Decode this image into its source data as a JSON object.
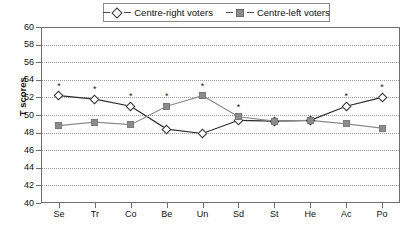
{
  "chart_data": {
    "type": "line",
    "title": "",
    "xlabel": "",
    "ylabel": "T scores",
    "ylim": [
      40,
      60
    ],
    "ytick_step": 2,
    "yticks": [
      60,
      58,
      56,
      54,
      52,
      50,
      48,
      46,
      44,
      42,
      40
    ],
    "grid": "horizontal-dotted",
    "legend_position": "top-center",
    "categories": [
      "Se",
      "Tr",
      "Co",
      "Be",
      "Un",
      "Sd",
      "St",
      "He",
      "Ac",
      "Po"
    ],
    "series": [
      {
        "name": "Centre-right voters",
        "marker": "open-diamond",
        "color": "#2b2b2b",
        "values": [
          52.2,
          51.8,
          51.0,
          48.4,
          47.9,
          49.4,
          49.3,
          49.4,
          51.0,
          52.0
        ]
      },
      {
        "name": "Centre-left voters",
        "marker": "filled-square",
        "color": "#8c8c8c",
        "values": [
          48.8,
          49.2,
          48.9,
          51.0,
          52.2,
          49.8,
          49.3,
          49.4,
          49.0,
          48.5
        ]
      }
    ],
    "annotations": {
      "symbol": "*",
      "significant_categories": [
        "Se",
        "Tr",
        "Co",
        "Be",
        "Un",
        "Sd",
        "Ac",
        "Po"
      ],
      "flags": [
        true,
        true,
        true,
        true,
        true,
        true,
        false,
        false,
        true,
        true
      ]
    }
  },
  "legend": {
    "entries": [
      {
        "label": "Centre-right voters",
        "marker": "open-diamond"
      },
      {
        "label": "Centre-left voters",
        "marker": "filled-square"
      }
    ]
  },
  "axes": {
    "y_title": "T scores"
  }
}
